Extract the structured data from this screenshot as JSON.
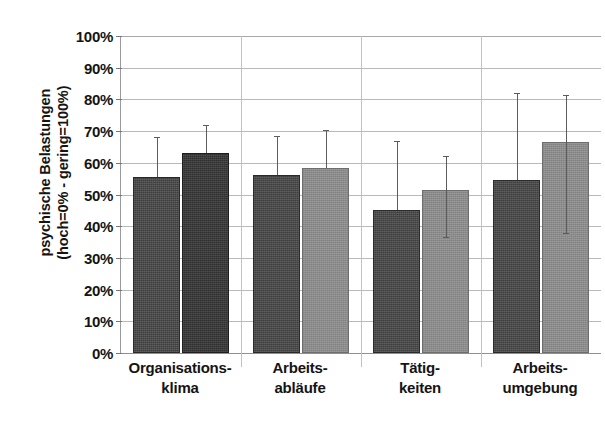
{
  "chart_data": {
    "type": "bar",
    "title": "",
    "subtitle": "",
    "xlabel": "",
    "ylabel": "psychische Belastungen (hoch=0% - gering=100%)",
    "ylabel_lines": [
      "psychische Belastungen",
      "(hoch=0% - gering=100%)"
    ],
    "ylim": [
      0,
      100
    ],
    "yticks": [
      0,
      10,
      20,
      30,
      40,
      50,
      60,
      70,
      80,
      90,
      100
    ],
    "ytick_labels": [
      "0%",
      "10%",
      "20%",
      "30%",
      "40%",
      "50%",
      "60%",
      "70%",
      "80%",
      "90%",
      "100%"
    ],
    "grid": true,
    "legend": "none",
    "error_bars": "asymmetric-whiskers",
    "categories": [
      "Organisations-klima",
      "Arbeits-abläufe",
      "Tätig-keiten",
      "Arbeits-umgebung"
    ],
    "category_lines": [
      [
        "Organisations-",
        "klima"
      ],
      [
        "Arbeits-",
        "abläufe"
      ],
      [
        "Tätig-",
        "keiten"
      ],
      [
        "Arbeits-",
        "umgebung"
      ]
    ],
    "series": [
      {
        "name": "Serie 1",
        "color": "#3e3e3e",
        "values": [
          55.5,
          56.0,
          45.0,
          54.5
        ],
        "err_low": [
          55.5,
          56.0,
          45.0,
          54.5
        ],
        "err_high": [
          68.0,
          68.5,
          67.0,
          82.0
        ]
      },
      {
        "name": "Serie 2",
        "color": "#8b8b8b",
        "values": [
          63.0,
          58.5,
          51.5,
          66.5
        ],
        "err_low": [
          63.0,
          58.5,
          36.5,
          38.0
        ],
        "err_high": [
          72.0,
          70.5,
          62.0,
          81.5
        ]
      }
    ]
  },
  "geometry": {
    "plot_left": 120,
    "plot_top": 36,
    "plot_width": 480,
    "plot_height": 317,
    "group_centers": [
      180,
      300,
      420,
      540
    ],
    "bar_width": 47,
    "bar_gap": 2
  }
}
